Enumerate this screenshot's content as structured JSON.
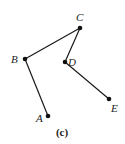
{
  "figure": {
    "caption": "(c)",
    "points": [
      {
        "id": "A",
        "label": "A",
        "x": 48,
        "y": 116,
        "lx": 36,
        "ly": 122
      },
      {
        "id": "B",
        "label": "B",
        "x": 25,
        "y": 59,
        "lx": 11,
        "ly": 63
      },
      {
        "id": "C",
        "label": "C",
        "x": 80,
        "y": 28,
        "lx": 76,
        "ly": 21
      },
      {
        "id": "D",
        "label": "D",
        "x": 65,
        "y": 62,
        "lx": 68,
        "ly": 66
      },
      {
        "id": "E",
        "label": "E",
        "x": 109,
        "y": 99,
        "lx": 111,
        "ly": 112
      }
    ],
    "edges": [
      [
        "A",
        "B"
      ],
      [
        "B",
        "C"
      ],
      [
        "C",
        "D"
      ],
      [
        "D",
        "E"
      ]
    ],
    "colors": {
      "line": "#1a1a1a",
      "node": "#111111",
      "background": "#ffffff"
    }
  }
}
